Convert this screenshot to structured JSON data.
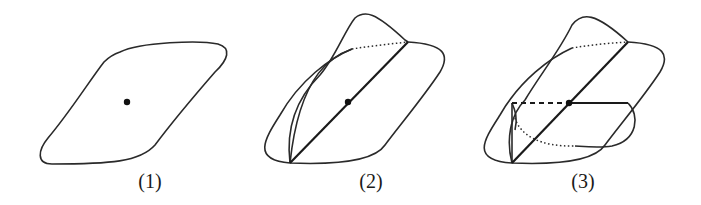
{
  "figure": {
    "panels": [
      {
        "id": 1,
        "label": "(1)",
        "description": "single planar region with center point"
      },
      {
        "id": 2,
        "label": "(2)",
        "description": "two regions intersecting along a line through the center point"
      },
      {
        "id": 3,
        "label": "(3)",
        "description": "three regions intersecting at the center point"
      }
    ]
  },
  "colors": {
    "stroke": "#2a2a2a",
    "background": "#ffffff"
  }
}
